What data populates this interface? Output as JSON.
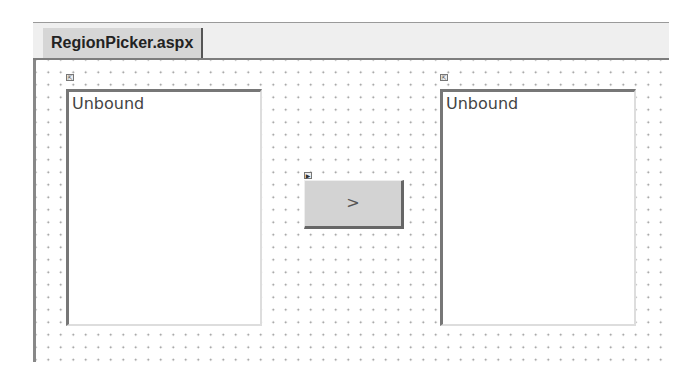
{
  "document_tab": {
    "label": "RegionPicker.aspx"
  },
  "designer": {
    "left_listbox": {
      "items": [
        "Unbound"
      ]
    },
    "move_button": {
      "label": ">"
    },
    "right_listbox": {
      "items": [
        "Unbound"
      ]
    }
  }
}
